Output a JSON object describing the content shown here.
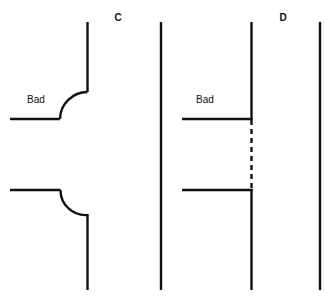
{
  "figure": {
    "background_color": "#ffffff",
    "stroke_color": "#111111",
    "width": 324,
    "height": 306
  },
  "panels": [
    {
      "id": "C",
      "label": "C",
      "label_x": 118,
      "label_y": 21,
      "annotation": "Bad",
      "annotation_x": 36,
      "annotation_y": 103
    },
    {
      "id": "D",
      "label": "D",
      "label_x": 283,
      "label_y": 21,
      "annotation": "Bad",
      "annotation_x": 205,
      "annotation_y": 103
    }
  ],
  "geometry": {
    "stroke_width": 2.4,
    "dash_pattern": "5 4",
    "vertical_lines": [
      {
        "name": "panel-c-upper-wall",
        "x": 87.5,
        "y1": 22,
        "y2": 92
      },
      {
        "name": "panel-c-lower-wall",
        "x": 87.5,
        "y1": 215,
        "y2": 290
      },
      {
        "name": "panel-c-right-boundary",
        "x": 161,
        "y1": 22,
        "y2": 290
      },
      {
        "name": "panel-d-main-wall-upper",
        "x": 251.5,
        "y1": 22,
        "y2": 120
      },
      {
        "name": "panel-d-main-wall-lower",
        "x": 251.5,
        "y1": 189,
        "y2": 290
      },
      {
        "name": "panel-d-right-boundary",
        "x": 320,
        "y1": 22,
        "y2": 290
      }
    ],
    "horizontal_lines": [
      {
        "name": "panel-c-upper-branch",
        "y": 119,
        "x1": 10,
        "x2": 60
      },
      {
        "name": "panel-c-lower-branch",
        "y": 190,
        "x1": 10,
        "x2": 60
      },
      {
        "name": "panel-d-upper-branch",
        "y": 119,
        "x1": 182,
        "x2": 252
      },
      {
        "name": "panel-d-lower-branch",
        "y": 190,
        "x1": 182,
        "x2": 252
      }
    ],
    "fillets": [
      {
        "name": "panel-c-upper-fillet",
        "path": "M 60 119 A 27.5 27.5 0 0 1 87.5 92",
        "kind": "convex"
      },
      {
        "name": "panel-c-lower-fillet",
        "path": "M 60 190 A 25 25 0 0 0 87.5 215",
        "kind": "concave"
      }
    ],
    "dashed_lines": [
      {
        "name": "panel-d-dashed-wall",
        "x": 251.5,
        "y1": 120,
        "y2": 189
      }
    ]
  }
}
